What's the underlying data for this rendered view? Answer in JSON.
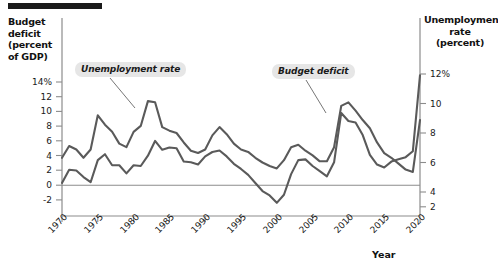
{
  "header": {
    "rule_name": "top-rule"
  },
  "axes": {
    "left_title": "Budget deficit (percent of GDP)",
    "right_title": "Unemployment rate (percent)",
    "x_title": "Year",
    "left_ticks": [
      "14%",
      "12",
      "10",
      "8",
      "6",
      "4",
      "2",
      "0",
      "-2"
    ],
    "right_ticks": [
      "12%",
      "10",
      "8",
      "6",
      "4",
      "2"
    ],
    "x_ticks": [
      "1970",
      "1975",
      "1980",
      "1985",
      "1990",
      "1995",
      "2000",
      "2005",
      "2010",
      "2015",
      "2020"
    ]
  },
  "annotations": {
    "unemployment": "Unemployment rate",
    "deficit": "Budget deficit"
  },
  "colors": {
    "line": "#5a5a5a",
    "zero_line": "#8c8c8c",
    "axis": "#8c8c8c",
    "callout_bg": "#e6e6e6",
    "text": "#1a1a1a",
    "rule": "#1a1a1a"
  },
  "chart_data": {
    "type": "line",
    "title": "",
    "xlabel": "Year",
    "grid": false,
    "legend": "annotated-callouts",
    "x": [
      1970,
      1971,
      1972,
      1973,
      1974,
      1975,
      1976,
      1977,
      1978,
      1979,
      1980,
      1981,
      1982,
      1983,
      1984,
      1985,
      1986,
      1987,
      1988,
      1989,
      1990,
      1991,
      1992,
      1993,
      1994,
      1995,
      1996,
      1997,
      1998,
      1999,
      2000,
      2001,
      2002,
      2003,
      2004,
      2005,
      2006,
      2007,
      2008,
      2009,
      2010,
      2011,
      2012,
      2013,
      2014,
      2015,
      2016,
      2017,
      2018,
      2019,
      2020
    ],
    "axes_mapping": {
      "left_axis_label": "Budget deficit (percent of GDP)",
      "left_ylim": [
        -3,
        15
      ],
      "right_axis_label": "Unemployment rate (percent)",
      "right_ylim": [
        1,
        13
      ],
      "note": "Unemployment series is plotted against the right axis; budget deficit against the left axis."
    },
    "series": [
      {
        "name": "Unemployment rate",
        "axis": "right",
        "unit": "percent",
        "values": [
          4.9,
          5.9,
          5.6,
          4.9,
          5.6,
          8.5,
          7.7,
          7.1,
          6.1,
          5.8,
          7.1,
          7.6,
          9.7,
          9.6,
          7.5,
          7.2,
          7.0,
          6.2,
          5.5,
          5.3,
          5.6,
          6.8,
          7.5,
          6.9,
          6.1,
          5.6,
          5.4,
          4.9,
          4.5,
          4.2,
          4.0,
          4.7,
          5.8,
          6.0,
          5.5,
          5.1,
          4.6,
          4.6,
          5.8,
          9.3,
          9.6,
          8.9,
          8.1,
          7.4,
          6.2,
          5.3,
          4.9,
          4.4,
          3.9,
          3.7,
          8.1
        ]
      },
      {
        "name": "Budget deficit",
        "axis": "left",
        "unit": "percent of GDP",
        "values": [
          0.3,
          2.1,
          2.0,
          1.1,
          0.4,
          3.4,
          4.2,
          2.7,
          2.7,
          1.6,
          2.7,
          2.6,
          4.0,
          6.0,
          4.8,
          5.1,
          5.0,
          3.2,
          3.1,
          2.8,
          3.9,
          4.5,
          4.7,
          3.9,
          2.9,
          2.2,
          1.4,
          0.3,
          -0.8,
          -1.4,
          -2.4,
          -1.3,
          1.5,
          3.4,
          3.5,
          2.6,
          1.9,
          1.2,
          3.1,
          9.8,
          8.7,
          8.5,
          6.8,
          4.1,
          2.8,
          2.4,
          3.2,
          3.5,
          3.8,
          4.6,
          14.9
        ]
      }
    ],
    "annotations": [
      {
        "text": "Unemployment rate",
        "points_to_year": 1982,
        "series": "Unemployment rate"
      },
      {
        "text": "Budget deficit",
        "points_to_year": 2009,
        "series": "Budget deficit"
      }
    ]
  }
}
